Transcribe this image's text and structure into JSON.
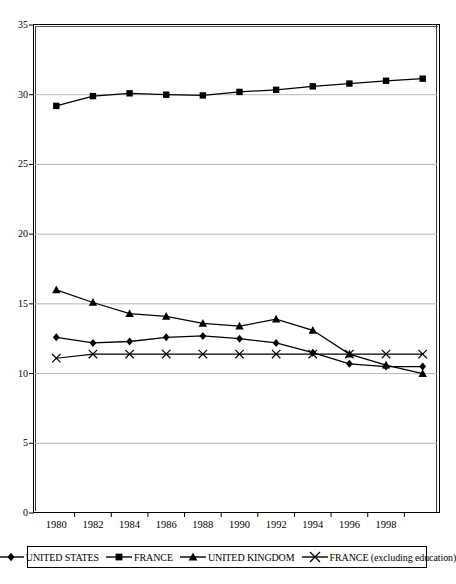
{
  "chart_data": {
    "type": "line",
    "title": "",
    "xlabel": "",
    "ylabel": "",
    "ylim": [
      0,
      35
    ],
    "yticks": [
      0,
      5,
      10,
      15,
      20,
      25,
      30,
      35
    ],
    "grid": "horizontal",
    "legend_position": "bottom",
    "categories": [
      "1980",
      "1982",
      "1984",
      "1986",
      "1988",
      "1990",
      "1992",
      "1994",
      "1996",
      "1998",
      ""
    ],
    "x": [
      1980,
      1982,
      1984,
      1986,
      1988,
      1990,
      1992,
      1994,
      1996,
      1998,
      2000
    ],
    "series": [
      {
        "name": "UNITED STATES",
        "marker": "diamond",
        "values": [
          12.6,
          12.2,
          12.3,
          12.6,
          12.7,
          12.5,
          12.2,
          11.5,
          10.7,
          10.5,
          10.5
        ]
      },
      {
        "name": "FRANCE",
        "marker": "square",
        "values": [
          29.2,
          29.9,
          30.1,
          30.0,
          29.95,
          30.2,
          30.35,
          30.6,
          30.8,
          31.0,
          31.15
        ]
      },
      {
        "name": "UNITED KINGDOM",
        "marker": "triangle",
        "values": [
          16.0,
          15.1,
          14.3,
          14.1,
          13.6,
          13.4,
          13.9,
          13.1,
          11.4,
          10.6,
          10.0
        ]
      },
      {
        "name": "FRANCE (excluding education)",
        "marker": "cross",
        "values": [
          11.1,
          11.4,
          11.4,
          11.4,
          11.4,
          11.4,
          11.4,
          11.4,
          11.4,
          11.4,
          11.4
        ]
      }
    ]
  },
  "legend": {
    "items": [
      {
        "label": "UNITED STATES",
        "marker": "diamond"
      },
      {
        "label": "FRANCE",
        "marker": "square"
      },
      {
        "label": "UNITED KINGDOM",
        "marker": "triangle"
      },
      {
        "label": "FRANCE (excluding education)",
        "marker": "cross"
      }
    ]
  },
  "caption": {
    "text": ""
  }
}
